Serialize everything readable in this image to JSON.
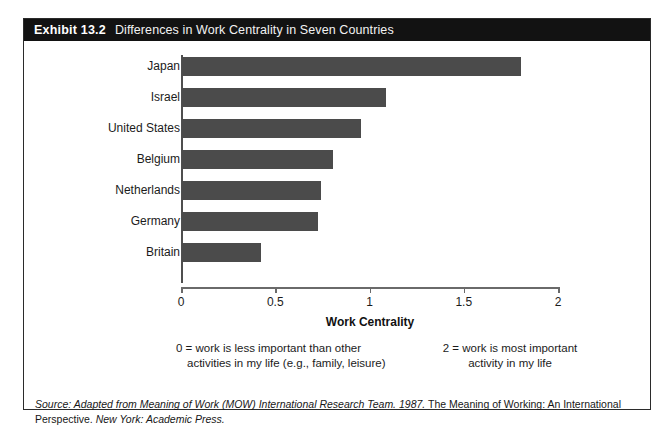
{
  "exhibit": {
    "number_label": "Exhibit 13.2",
    "caption": "Differences in Work Centrality in Seven Countries"
  },
  "chart_data": {
    "type": "bar",
    "orientation": "horizontal",
    "title": "Differences in Work Centrality in Seven Countries",
    "categories": [
      "Japan",
      "Israel",
      "United States",
      "Belgium",
      "Netherlands",
      "Germany",
      "Britain"
    ],
    "values": [
      1.8,
      1.08,
      0.95,
      0.8,
      0.74,
      0.72,
      0.42
    ],
    "xlabel": "Work Centrality",
    "ylabel": "",
    "xlim": [
      0,
      2
    ],
    "xticks": [
      0,
      0.5,
      1,
      1.5,
      2
    ],
    "xtick_labels": [
      "0",
      "0.5",
      "1",
      "1.5",
      "2"
    ],
    "grid": false,
    "legend": false,
    "bar_color": "#4b4b4b",
    "annotations": [
      "0 = work is less important than other activities in my life (e.g., family, leisure)",
      "2 = work is most important activity in my life"
    ]
  },
  "axis": {
    "x_title": "Work Centrality"
  },
  "notes": {
    "left": {
      "line1": "0 = work is less important than other",
      "line2": "activities in my life (e.g., family,",
      "line3": "leisure)"
    },
    "right": {
      "line1": "2 = work is most important",
      "line2": "activity in my life"
    }
  },
  "source": {
    "prefix": "Source: Adapted from Meaning of Work (MOW) International Research Team. 1987.",
    "roman_part": " The Meaning of Working: An International Perspective.",
    "suffix": " New York: Academic Press."
  }
}
